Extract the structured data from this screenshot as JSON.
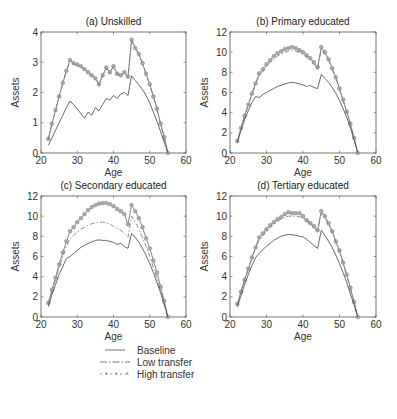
{
  "chart_data": [
    {
      "type": "line",
      "title": "(a) Unskilled",
      "xlabel": "Age",
      "ylabel": "Assets",
      "xlim": [
        20,
        60
      ],
      "ylim": [
        0,
        4
      ],
      "xticks": [
        20,
        30,
        40,
        50,
        60
      ],
      "yticks": [
        0,
        1,
        2,
        3,
        4
      ],
      "grid": false,
      "x": [
        22,
        23,
        24,
        25,
        26,
        27,
        28,
        29,
        30,
        31,
        32,
        33,
        34,
        35,
        36,
        37,
        38,
        39,
        40,
        41,
        42,
        43,
        44,
        45,
        46,
        47,
        48,
        49,
        50,
        51,
        52,
        53,
        54,
        55
      ],
      "series": [
        {
          "name": "Baseline",
          "style": "solid",
          "values": [
            0.25,
            0.5,
            0.75,
            1.0,
            1.25,
            1.5,
            1.72,
            1.6,
            1.45,
            1.3,
            1.15,
            1.35,
            1.25,
            1.5,
            1.4,
            1.6,
            1.8,
            1.75,
            1.9,
            1.8,
            1.95,
            2.0,
            1.9,
            2.55,
            2.4,
            2.25,
            2.1,
            1.9,
            1.65,
            1.35,
            1.05,
            0.7,
            0.35,
            0.0
          ]
        },
        {
          "name": "Low transfer",
          "style": "dashdot",
          "values": [
            0.45,
            0.95,
            1.4,
            1.85,
            2.3,
            2.7,
            3.05,
            2.95,
            2.9,
            2.85,
            2.75,
            2.65,
            2.55,
            2.45,
            2.25,
            2.55,
            2.8,
            2.65,
            2.85,
            2.6,
            2.55,
            2.65,
            2.5,
            3.72,
            3.45,
            3.25,
            2.95,
            2.6,
            2.25,
            1.85,
            1.45,
            0.95,
            0.5,
            0.0
          ]
        },
        {
          "name": "High transfer",
          "style": "star-dot",
          "values": [
            0.47,
            0.97,
            1.42,
            1.87,
            2.32,
            2.72,
            3.07,
            2.97,
            2.92,
            2.87,
            2.77,
            2.67,
            2.57,
            2.47,
            2.27,
            2.57,
            2.82,
            2.67,
            2.87,
            2.62,
            2.57,
            2.67,
            2.52,
            3.75,
            3.47,
            3.27,
            2.97,
            2.62,
            2.27,
            1.87,
            1.47,
            0.97,
            0.52,
            0.0
          ]
        }
      ]
    },
    {
      "type": "line",
      "title": "(b) Primary educated",
      "xlabel": "Age",
      "ylabel": "Assets",
      "xlim": [
        20,
        60
      ],
      "ylim": [
        0,
        12
      ],
      "xticks": [
        20,
        30,
        40,
        50,
        60
      ],
      "yticks": [
        0,
        2,
        4,
        6,
        8,
        10,
        12
      ],
      "grid": false,
      "x": [
        22,
        23,
        24,
        25,
        26,
        27,
        28,
        29,
        30,
        31,
        32,
        33,
        34,
        35,
        36,
        37,
        38,
        39,
        40,
        41,
        42,
        43,
        44,
        45,
        46,
        47,
        48,
        49,
        50,
        51,
        52,
        53,
        54,
        55
      ],
      "series": [
        {
          "name": "Baseline",
          "style": "solid",
          "values": [
            1.0,
            2.2,
            3.3,
            4.2,
            5.0,
            5.6,
            5.5,
            5.8,
            6.0,
            6.2,
            6.4,
            6.6,
            6.7,
            6.85,
            6.95,
            7.0,
            6.95,
            6.85,
            6.75,
            6.6,
            6.7,
            6.5,
            6.4,
            7.8,
            7.4,
            7.0,
            6.5,
            5.9,
            5.2,
            4.4,
            3.5,
            2.5,
            1.3,
            0.0
          ]
        },
        {
          "name": "Low transfer",
          "style": "dashdot",
          "values": [
            1.1,
            2.4,
            3.6,
            4.7,
            5.8,
            6.8,
            7.7,
            8.1,
            8.6,
            9.0,
            9.3,
            9.6,
            9.8,
            10.0,
            10.1,
            10.15,
            10.1,
            10.0,
            9.8,
            9.5,
            9.2,
            8.8,
            8.3,
            10.3,
            9.8,
            9.2,
            8.3,
            7.4,
            6.3,
            5.2,
            4.0,
            2.8,
            1.4,
            0.0
          ]
        },
        {
          "name": "High transfer",
          "style": "star-dot",
          "values": [
            1.2,
            2.5,
            3.7,
            4.8,
            5.9,
            6.9,
            7.9,
            8.3,
            8.8,
            9.2,
            9.6,
            9.9,
            10.1,
            10.3,
            10.4,
            10.5,
            10.4,
            10.2,
            10.0,
            9.7,
            9.4,
            9.0,
            8.5,
            10.5,
            10.0,
            9.3,
            8.4,
            7.5,
            6.4,
            5.3,
            4.1,
            2.9,
            1.5,
            0.0
          ]
        }
      ]
    },
    {
      "type": "line",
      "title": "(c) Secondary educated",
      "xlabel": "Age",
      "ylabel": "Assets",
      "xlim": [
        20,
        60
      ],
      "ylim": [
        0,
        12
      ],
      "xticks": [
        20,
        30,
        40,
        50,
        60
      ],
      "yticks": [
        0,
        2,
        4,
        6,
        8,
        10,
        12
      ],
      "grid": false,
      "x": [
        22,
        23,
        24,
        25,
        26,
        27,
        28,
        29,
        30,
        31,
        32,
        33,
        34,
        35,
        36,
        37,
        38,
        39,
        40,
        41,
        42,
        43,
        44,
        45,
        46,
        47,
        48,
        49,
        50,
        51,
        52,
        53,
        54,
        55
      ],
      "series": [
        {
          "name": "Baseline",
          "style": "solid",
          "values": [
            1.0,
            2.2,
            3.2,
            4.2,
            5.0,
            5.8,
            6.0,
            6.3,
            6.6,
            6.9,
            7.1,
            7.3,
            7.45,
            7.6,
            7.65,
            7.6,
            7.6,
            7.5,
            7.4,
            7.2,
            7.3,
            7.0,
            6.8,
            8.3,
            7.9,
            7.4,
            6.8,
            6.1,
            5.3,
            4.4,
            3.4,
            2.4,
            1.2,
            0.0
          ]
        },
        {
          "name": "Low transfer",
          "style": "dashdot",
          "values": [
            1.2,
            2.5,
            3.7,
            4.9,
            6.0,
            7.0,
            7.8,
            8.1,
            8.4,
            8.7,
            8.9,
            9.1,
            9.25,
            9.35,
            9.4,
            9.4,
            9.35,
            9.2,
            9.0,
            8.8,
            8.6,
            8.3,
            7.9,
            10.0,
            9.4,
            8.7,
            7.9,
            7.0,
            6.0,
            4.9,
            3.8,
            2.6,
            1.3,
            0.0
          ]
        },
        {
          "name": "High transfer",
          "style": "star-dot",
          "values": [
            1.4,
            2.7,
            3.9,
            5.2,
            6.4,
            7.5,
            8.5,
            8.9,
            9.4,
            9.8,
            10.2,
            10.6,
            10.9,
            11.1,
            11.25,
            11.3,
            11.3,
            11.2,
            11.0,
            10.7,
            10.5,
            10.2,
            9.2,
            11.1,
            10.5,
            9.8,
            8.9,
            7.8,
            6.8,
            5.6,
            4.4,
            3.0,
            1.6,
            0.0
          ]
        }
      ]
    },
    {
      "type": "line",
      "title": "(d) Tertiary educated",
      "xlabel": "Age",
      "ylabel": "Assets",
      "xlim": [
        20,
        60
      ],
      "ylim": [
        0,
        12
      ],
      "xticks": [
        20,
        30,
        40,
        50,
        60
      ],
      "yticks": [
        0,
        2,
        4,
        6,
        8,
        10,
        12
      ],
      "grid": false,
      "x": [
        22,
        23,
        24,
        25,
        26,
        27,
        28,
        29,
        30,
        31,
        32,
        33,
        34,
        35,
        36,
        37,
        38,
        39,
        40,
        41,
        42,
        43,
        44,
        45,
        46,
        47,
        48,
        49,
        50,
        51,
        52,
        53,
        54,
        55
      ],
      "series": [
        {
          "name": "Baseline",
          "style": "solid",
          "values": [
            1.0,
            2.1,
            3.2,
            4.2,
            5.1,
            5.9,
            6.3,
            6.7,
            7.0,
            7.3,
            7.6,
            7.8,
            8.0,
            8.1,
            8.2,
            8.15,
            8.1,
            8.0,
            7.95,
            7.7,
            7.4,
            7.1,
            6.8,
            8.6,
            8.1,
            7.5,
            6.9,
            6.1,
            5.3,
            4.4,
            3.4,
            2.3,
            1.2,
            0.0
          ]
        },
        {
          "name": "Low transfer",
          "style": "dashdot",
          "values": [
            1.2,
            2.4,
            3.6,
            4.7,
            5.8,
            6.8,
            7.7,
            8.1,
            8.5,
            8.9,
            9.2,
            9.5,
            9.7,
            9.9,
            10.0,
            10.0,
            10.0,
            9.95,
            9.8,
            9.5,
            9.2,
            8.9,
            8.5,
            10.3,
            9.8,
            9.2,
            8.4,
            7.4,
            6.4,
            5.3,
            4.0,
            2.8,
            1.4,
            0.0
          ]
        },
        {
          "name": "High transfer",
          "style": "star-dot",
          "values": [
            1.3,
            2.5,
            3.7,
            4.8,
            5.9,
            6.9,
            7.9,
            8.3,
            8.7,
            9.1,
            9.4,
            9.7,
            9.9,
            10.2,
            10.4,
            10.3,
            10.3,
            10.3,
            10.0,
            9.6,
            9.3,
            9.0,
            8.6,
            10.5,
            10.0,
            9.3,
            8.5,
            7.5,
            6.6,
            5.4,
            4.2,
            2.9,
            1.5,
            0.0
          ]
        }
      ]
    }
  ],
  "legend": {
    "items": [
      {
        "label": "Baseline",
        "style": "solid"
      },
      {
        "label": "Low transfer",
        "style": "dashdot"
      },
      {
        "label": "High transfer",
        "style": "star-dot"
      }
    ]
  }
}
